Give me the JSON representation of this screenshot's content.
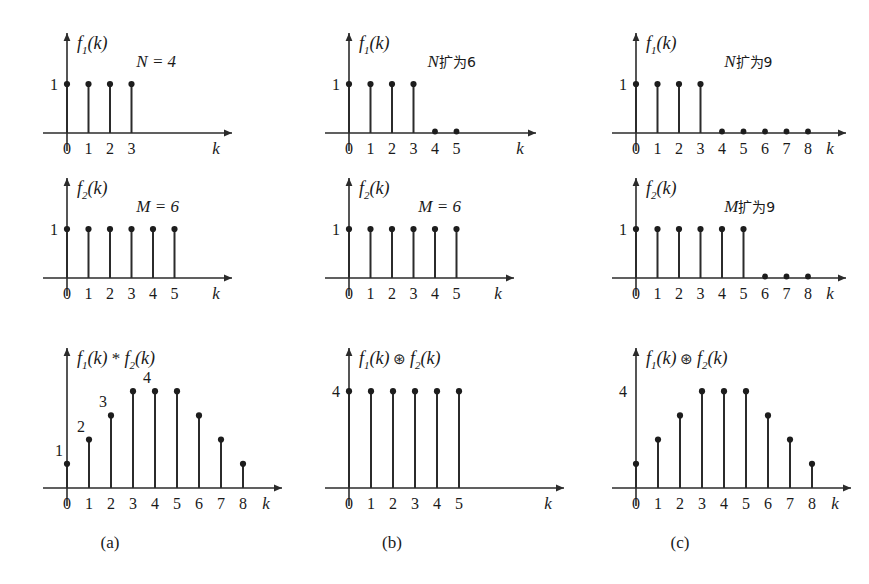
{
  "figure": {
    "background": "#ffffff",
    "ink_color": "#1d1d1d",
    "columns": [
      {
        "caption": "(a)"
      },
      {
        "caption": "(b)"
      },
      {
        "caption": "(c)"
      }
    ]
  },
  "chart_data": [
    {
      "id": "a-top",
      "type": "bar",
      "title": "f₁(k)",
      "title_parts": {
        "f": "f",
        "sub": "1",
        "arg": "(k)"
      },
      "annotation": "N = 4",
      "annotation_italic": "N = 4",
      "xlabel": "k",
      "ylabel": "",
      "ytick_labels": [
        "1"
      ],
      "ytick_values": [
        1
      ],
      "categories": [
        "0",
        "1",
        "2",
        "3"
      ],
      "x": [
        0,
        1,
        2,
        3
      ],
      "values": [
        1,
        1,
        1,
        1
      ],
      "zero_samples": [],
      "ylim": [
        0,
        1.25
      ],
      "xlim": [
        -0.6,
        6.2
      ],
      "grid": false,
      "legend": "none",
      "value_labels": []
    },
    {
      "id": "b-top",
      "type": "bar",
      "title": "f₁(k)",
      "title_parts": {
        "f": "f",
        "sub": "1",
        "arg": "(k)"
      },
      "annotation": "N扩为6",
      "annotation_prefix": "N",
      "annotation_cn": "扩为6",
      "xlabel": "k",
      "ylabel": "",
      "ytick_labels": [
        "1"
      ],
      "ytick_values": [
        1
      ],
      "categories": [
        "0",
        "1",
        "2",
        "3",
        "4",
        "5"
      ],
      "x": [
        0,
        1,
        2,
        3,
        4,
        5
      ],
      "values": [
        1,
        1,
        1,
        1,
        0,
        0
      ],
      "zero_samples": [
        4,
        5
      ],
      "ylim": [
        0,
        1.25
      ],
      "xlim": [
        -0.6,
        7.2
      ],
      "grid": false,
      "legend": "none",
      "value_labels": []
    },
    {
      "id": "c-top",
      "type": "bar",
      "title": "f₁(k)",
      "title_parts": {
        "f": "f",
        "sub": "1",
        "arg": "(k)"
      },
      "annotation": "N扩为9",
      "annotation_prefix": "N",
      "annotation_cn": "扩为9",
      "xlabel": "k",
      "ylabel": "",
      "ytick_labels": [
        "1"
      ],
      "ytick_values": [
        1
      ],
      "categories": [
        "0",
        "1",
        "2",
        "3",
        "4",
        "5",
        "6",
        "7",
        "8"
      ],
      "x": [
        0,
        1,
        2,
        3,
        4,
        5,
        6,
        7,
        8
      ],
      "values": [
        1,
        1,
        1,
        1,
        0,
        0,
        0,
        0,
        0
      ],
      "zero_samples": [
        4,
        5,
        6,
        7,
        8
      ],
      "ylim": [
        0,
        1.25
      ],
      "xlim": [
        -0.6,
        9.6
      ],
      "grid": false,
      "legend": "none",
      "value_labels": []
    },
    {
      "id": "a-mid",
      "type": "bar",
      "title": "f₂(k)",
      "title_parts": {
        "f": "f",
        "sub": "2",
        "arg": "(k)"
      },
      "annotation": "M = 6",
      "annotation_italic": "M = 6",
      "xlabel": "k",
      "ylabel": "",
      "ytick_labels": [
        "1"
      ],
      "ytick_values": [
        1
      ],
      "categories": [
        "0",
        "1",
        "2",
        "3",
        "4",
        "5"
      ],
      "x": [
        0,
        1,
        2,
        3,
        4,
        5
      ],
      "values": [
        1,
        1,
        1,
        1,
        1,
        1
      ],
      "zero_samples": [],
      "ylim": [
        0,
        1.25
      ],
      "xlim": [
        -0.6,
        7.2
      ],
      "grid": false,
      "legend": "none",
      "value_labels": []
    },
    {
      "id": "b-mid",
      "type": "bar",
      "title": "f₂(k)",
      "title_parts": {
        "f": "f",
        "sub": "2",
        "arg": "(k)"
      },
      "annotation": "M = 6",
      "annotation_italic": "M = 6",
      "xlabel": "k",
      "ylabel": "",
      "ytick_labels": [
        "1"
      ],
      "ytick_values": [
        1
      ],
      "categories": [
        "0",
        "1",
        "2",
        "3",
        "4",
        "5"
      ],
      "x": [
        0,
        1,
        2,
        3,
        4,
        5
      ],
      "values": [
        1,
        1,
        1,
        1,
        1,
        1
      ],
      "zero_samples": [],
      "ylim": [
        0,
        1.25
      ],
      "xlim": [
        -0.6,
        7.2
      ],
      "grid": false,
      "legend": "none",
      "value_labels": []
    },
    {
      "id": "c-mid",
      "type": "bar",
      "title": "f₂(k)",
      "title_parts": {
        "f": "f",
        "sub": "2",
        "arg": "(k)"
      },
      "annotation": "M扩为9",
      "annotation_prefix": "M",
      "annotation_cn": "扩为9",
      "xlabel": "k",
      "ylabel": "",
      "ytick_labels": [
        "1"
      ],
      "ytick_values": [
        1
      ],
      "categories": [
        "0",
        "1",
        "2",
        "3",
        "4",
        "5",
        "6",
        "7",
        "8"
      ],
      "x": [
        0,
        1,
        2,
        3,
        4,
        5,
        6,
        7,
        8
      ],
      "values": [
        1,
        1,
        1,
        1,
        1,
        1,
        0,
        0,
        0
      ],
      "zero_samples": [
        6,
        7,
        8
      ],
      "ylim": [
        0,
        1.25
      ],
      "xlim": [
        -0.6,
        9.6
      ],
      "grid": false,
      "legend": "none",
      "value_labels": []
    },
    {
      "id": "a-bot",
      "type": "bar",
      "title": "f₁(k) * f₂(k)",
      "title_parts": {
        "f": "f",
        "sub": "1",
        "arg": "(k)",
        "op": "*",
        "f2": "f",
        "sub2": "2",
        "arg2": "(k)"
      },
      "operator": "*",
      "operator_name": "linear-convolution",
      "annotation": "",
      "xlabel": "k",
      "ylabel": "",
      "ytick_labels": [],
      "ytick_values": [],
      "categories": [
        "0",
        "1",
        "2",
        "3",
        "4",
        "5",
        "6",
        "7",
        "8"
      ],
      "x": [
        0,
        1,
        2,
        3,
        4,
        5,
        6,
        7,
        8
      ],
      "values": [
        1,
        2,
        3,
        4,
        4,
        4,
        3,
        2,
        1
      ],
      "zero_samples": [],
      "ylim": [
        0,
        4.6
      ],
      "xlim": [
        -0.6,
        9.6
      ],
      "grid": false,
      "legend": "none",
      "value_labels": [
        {
          "x": 0,
          "text": "1"
        },
        {
          "x": 1,
          "text": "2"
        },
        {
          "x": 2,
          "text": "3"
        },
        {
          "x": 4,
          "text": "4"
        }
      ]
    },
    {
      "id": "b-bot",
      "type": "bar",
      "title": "f₁(k) ⊛ f₂(k)",
      "title_parts": {
        "f": "f",
        "sub": "1",
        "arg": "(k)",
        "op": "⊛",
        "f2": "f",
        "sub2": "2",
        "arg2": "(k)"
      },
      "operator": "⊛",
      "operator_name": "circular-convolution",
      "annotation": "",
      "xlabel": "k",
      "ylabel": "",
      "ytick_labels": [
        "4"
      ],
      "ytick_values": [
        4
      ],
      "categories": [
        "0",
        "1",
        "2",
        "3",
        "4",
        "5"
      ],
      "x": [
        0,
        1,
        2,
        3,
        4,
        5
      ],
      "values": [
        4,
        4,
        4,
        4,
        4,
        4
      ],
      "zero_samples": [],
      "ylim": [
        0,
        4.6
      ],
      "xlim": [
        -0.6,
        7.6
      ],
      "grid": false,
      "legend": "none",
      "value_labels": []
    },
    {
      "id": "c-bot",
      "type": "bar",
      "title": "f₁(k) ⊛ f₂(k)",
      "title_parts": {
        "f": "f",
        "sub": "1",
        "arg": "(k)",
        "op": "⊛",
        "f2": "f",
        "sub2": "2",
        "arg2": "(k)"
      },
      "operator": "⊛",
      "operator_name": "circular-convolution",
      "annotation": "",
      "xlabel": "k",
      "ylabel": "",
      "ytick_labels": [
        "4"
      ],
      "ytick_values": [
        4
      ],
      "categories": [
        "0",
        "1",
        "2",
        "3",
        "4",
        "5",
        "6",
        "7",
        "8"
      ],
      "x": [
        0,
        1,
        2,
        3,
        4,
        5,
        6,
        7,
        8
      ],
      "values": [
        1,
        2,
        3,
        4,
        4,
        4,
        3,
        2,
        1
      ],
      "zero_samples": [],
      "ylim": [
        0,
        4.6
      ],
      "xlim": [
        -0.6,
        9.6
      ],
      "grid": false,
      "legend": "none",
      "value_labels": []
    }
  ]
}
